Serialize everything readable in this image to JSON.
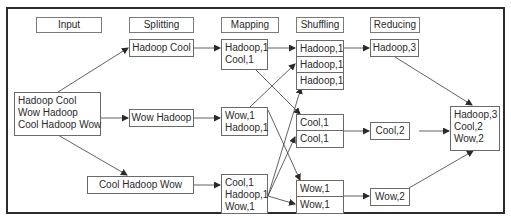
{
  "diagram": {
    "headers": [
      "Input",
      "Splitting",
      "Mapping",
      "Shuffling",
      "Reducing"
    ],
    "input": {
      "lines": [
        "Hadoop Cool",
        "Wow Hadoop",
        "Cool Hadoop Wow"
      ]
    },
    "splitting": [
      {
        "label": "Hadoop Cool"
      },
      {
        "label": "Wow Hadoop"
      },
      {
        "label": "Cool Hadoop Wow"
      }
    ],
    "mapping": [
      {
        "lines": [
          "Hadoop,1",
          "Cool,1"
        ]
      },
      {
        "lines": [
          "Wow,1",
          "Hadoop,1"
        ]
      },
      {
        "lines": [
          "Cool,1",
          "Hadoop,1",
          "Wow,1"
        ]
      }
    ],
    "shuffling": [
      {
        "key": "Hadoop",
        "rows": [
          "Hadoop,1",
          "Hadoop,1",
          "Hadoop,1"
        ]
      },
      {
        "key": "Cool",
        "rows": [
          "Cool,1",
          "Cool,1"
        ]
      },
      {
        "key": "Wow",
        "rows": [
          "Wow,1",
          "Wow,1"
        ]
      }
    ],
    "reducing": [
      {
        "label": "Hadoop,3"
      },
      {
        "label": "Cool,2"
      },
      {
        "label": "Wow,2"
      }
    ],
    "result": {
      "lines": [
        "Hadoop,3",
        "Cool,2",
        "Wow,2"
      ]
    },
    "colors": {
      "border": "#6a6a6a",
      "frame": "#2b2b2b",
      "arrow": "#3a3a3a",
      "text": "#2a2a2a"
    }
  }
}
